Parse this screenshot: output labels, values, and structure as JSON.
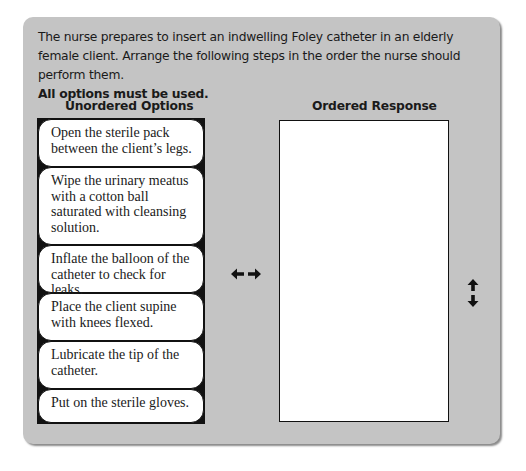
{
  "question": {
    "prompt": "The nurse prepares to insert an indwelling Foley catheter in an elderly female client. Arrange the following steps in the order the nurse should perform them.",
    "instruction": "All options must be used."
  },
  "unordered": {
    "header": "Unordered Options",
    "items": [
      {
        "label": "Open the sterile pack between the client’s legs."
      },
      {
        "label": "Wipe the urinary meatus with a cotton ball saturated with cleansing solution."
      },
      {
        "label": "Inflate the balloon of the catheter to check for leaks."
      },
      {
        "label": "Place the client supine with knees flexed."
      },
      {
        "label": "Lubricate the tip of the catheter."
      },
      {
        "label": "Put on the sterile gloves."
      }
    ]
  },
  "ordered": {
    "header": "Ordered Response",
    "items": []
  },
  "controls": {
    "move_icon": "left-right-arrow-icon",
    "reorder_icon": "up-down-arrow-icon"
  },
  "colors": {
    "card_background": "#c4c4c4",
    "option_background": "#ffffff",
    "border": "#111111"
  }
}
